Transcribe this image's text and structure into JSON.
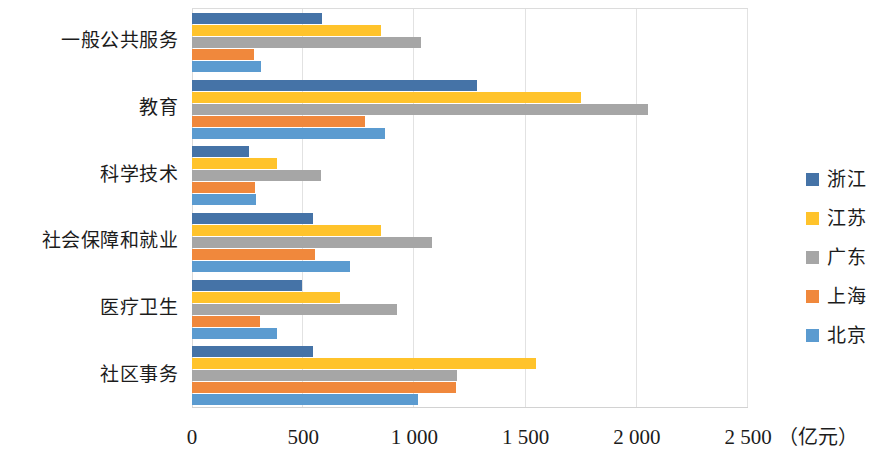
{
  "chart_data": {
    "type": "bar",
    "orientation": "horizontal",
    "title": "",
    "xlabel": "（亿元）",
    "ylabel": "",
    "xlim": [
      0,
      2500
    ],
    "xticks": [
      "0",
      "500",
      "1 000",
      "1 500",
      "2 000",
      "2 500"
    ],
    "xtick_values": [
      0,
      500,
      1000,
      1500,
      2000,
      2500
    ],
    "grid": true,
    "legend_position": "right",
    "categories": [
      "一般公共服务",
      "教育",
      "科学技术",
      "社会保障和就业",
      "医疗卫生",
      "社区事务"
    ],
    "series": [
      {
        "name": "浙江",
        "color": "#4573A7",
        "values": [
          585,
          1280,
          255,
          545,
          495,
          545
        ]
      },
      {
        "name": "江苏",
        "color": "#FFC32B",
        "values": [
          850,
          1750,
          380,
          850,
          665,
          1545
        ]
      },
      {
        "name": "广东",
        "color": "#A6A6A6",
        "values": [
          1030,
          2050,
          578,
          1080,
          920,
          1190
        ]
      },
      {
        "name": "上海",
        "color": "#F0883C",
        "values": [
          280,
          780,
          285,
          555,
          305,
          1185
        ]
      },
      {
        "name": "北京",
        "color": "#5B9BD0",
        "values": [
          310,
          870,
          290,
          710,
          380,
          1015
        ]
      }
    ]
  }
}
